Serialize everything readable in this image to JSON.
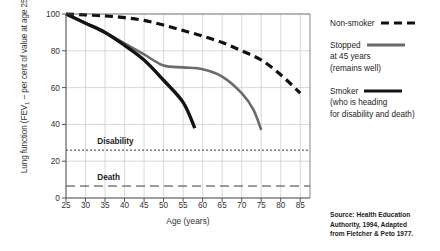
{
  "chart_data": {
    "type": "line",
    "title": "",
    "xlabel": "Age (years)",
    "ylabel": "Lung function (FEV1 – per cent of value at age 25)",
    "ylabel_prefix": "Lung function (FEV",
    "ylabel_subscript": "1",
    "ylabel_suffix": " – per cent of value at age 25)",
    "xlim": [
      25,
      87.5
    ],
    "ylim": [
      0,
      100
    ],
    "xticks": [
      25,
      30,
      35,
      40,
      45,
      50,
      55,
      60,
      65,
      70,
      75,
      80,
      85
    ],
    "yticks": [
      0,
      20,
      40,
      60,
      80,
      100
    ],
    "grid": true,
    "legend_position": "right",
    "series": [
      {
        "name": "Non-smoker",
        "style": "dashed",
        "color": "#111111",
        "width": 3.2,
        "x": [
          25,
          30,
          35,
          40,
          45,
          50,
          55,
          60,
          65,
          70,
          75,
          80,
          85
        ],
        "values": [
          100,
          99.5,
          99,
          98,
          96.5,
          94,
          91,
          88,
          84.5,
          80,
          75,
          67,
          57
        ]
      },
      {
        "name": "Stopped at 45 years",
        "style": "solid",
        "color": "#6b6b6b",
        "width": 2.6,
        "x": [
          25,
          30,
          35,
          40,
          45,
          50,
          55,
          60,
          65,
          70,
          73,
          75
        ],
        "values": [
          100,
          95,
          90,
          84,
          78,
          72,
          71,
          70,
          66,
          57,
          48,
          37
        ]
      },
      {
        "name": "Smoker",
        "style": "solid",
        "color": "#141414",
        "width": 3.4,
        "x": [
          25,
          30,
          35,
          40,
          45,
          50,
          55,
          58
        ],
        "values": [
          100,
          95,
          90,
          83,
          75,
          64,
          52,
          38
        ]
      }
    ],
    "reference_lines": [
      {
        "label": "Disability",
        "value": 26,
        "style": "dotted",
        "label_x": 33
      },
      {
        "label": "Death",
        "value": 6.5,
        "style": "dashed",
        "label_x": 33
      }
    ]
  },
  "legend": {
    "entries": [
      {
        "title": "Non-smoker",
        "sub": "",
        "sub2": "",
        "style": "dashed",
        "color": "#111111",
        "width": 3.2
      },
      {
        "title": "Stopped",
        "sub": "at 45 years",
        "sub2": "(remains well)",
        "style": "solid",
        "color": "#6b6b6b",
        "width": 2.8
      },
      {
        "title": "Smoker",
        "sub": "(who is heading",
        "sub2": "for disability and death)",
        "style": "solid",
        "color": "#141414",
        "width": 3.2
      }
    ]
  },
  "source": {
    "line1": "Source: Health Education",
    "line2": "Authority, 1994, Adapted",
    "line3": "from Fletcher & Peto 1977."
  }
}
